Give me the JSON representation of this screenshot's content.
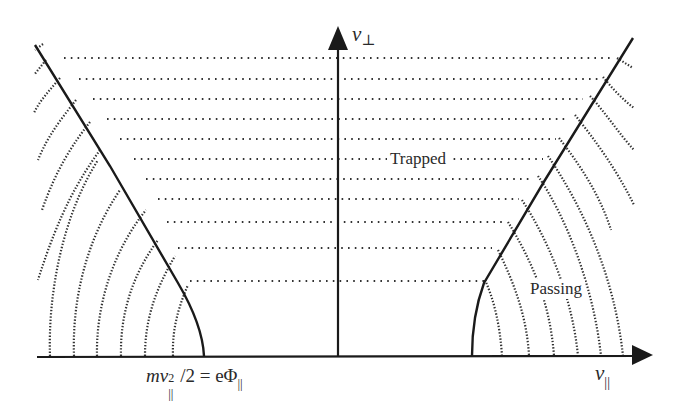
{
  "diagram": {
    "axes": {
      "vertical_label_main": "v",
      "vertical_label_sub": "⊥",
      "horizontal_label_main": "v",
      "horizontal_label_sub": "||"
    },
    "regions": {
      "trapped_label": "Trapped",
      "passing_label": "Passing"
    },
    "boundary_equation": {
      "m": "m",
      "v": "v",
      "sup": "2",
      "sub": "||",
      "rest": "/2 = e",
      "phi": "Φ",
      "phi_sub": "||"
    },
    "colors": {
      "line": "#1a1a1a",
      "dots": "#333333",
      "text": "#2a2a2a"
    },
    "geometry": {
      "origin": [
        338,
        357
      ],
      "horizontal_dotted_y": [
        58,
        79,
        99,
        119,
        139,
        159,
        179,
        199,
        222,
        248,
        281
      ],
      "left_arc_bottom_x": [
        50,
        74,
        97,
        121,
        145,
        173
      ],
      "right_arc_bottom_x": [
        502,
        529,
        554,
        578,
        601,
        623
      ]
    }
  }
}
